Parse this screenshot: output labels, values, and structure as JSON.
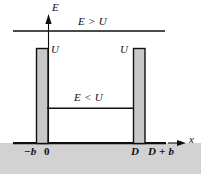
{
  "figure": {
    "type": "potential-well-energy-diagram",
    "axes": {
      "y_axis_label": "E",
      "x_axis_label": "x"
    },
    "energy_levels": [
      {
        "name": "above-barrier",
        "label": "E > U"
      },
      {
        "name": "below-barrier",
        "label": "E < U"
      }
    ],
    "barrier_labels": {
      "left": "U",
      "right": "U"
    },
    "x_ticks": [
      {
        "label": "−b"
      },
      {
        "label": "0"
      },
      {
        "label": "D"
      },
      {
        "label": "D + b"
      }
    ],
    "colors": {
      "barrier_fill": "#c8c8c8",
      "ground_band": "#d2d2d2",
      "stroke": "#100f0f",
      "background": "#ffffff"
    },
    "geometry": {
      "left_barrier": {
        "x": 36,
        "width": 12,
        "top": 48,
        "bottom": 143
      },
      "right_barrier": {
        "x": 133,
        "width": 12,
        "top": 48,
        "bottom": 143
      },
      "baseline_y": 143,
      "upper_line_y": 31,
      "inner_line_y": 108,
      "y_axis_x": 48,
      "axis_left": 13,
      "axis_right": 165
    }
  }
}
